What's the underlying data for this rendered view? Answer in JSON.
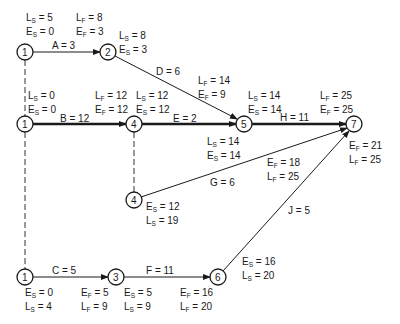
{
  "diagram": {
    "type": "PERT / CPM activity network",
    "nodes": [
      {
        "id": "n1a",
        "label": "1",
        "x": 25,
        "y": 52
      },
      {
        "id": "n2",
        "label": "2",
        "x": 108,
        "y": 52
      },
      {
        "id": "n1b",
        "label": "1",
        "x": 25,
        "y": 124
      },
      {
        "id": "n4a",
        "label": "4",
        "x": 134,
        "y": 124
      },
      {
        "id": "n5",
        "label": "5",
        "x": 244,
        "y": 124
      },
      {
        "id": "n7",
        "label": "7",
        "x": 354,
        "y": 124
      },
      {
        "id": "n4b",
        "label": "4",
        "x": 134,
        "y": 200
      },
      {
        "id": "n1c",
        "label": "1",
        "x": 25,
        "y": 277
      },
      {
        "id": "n3",
        "label": "3",
        "x": 116,
        "y": 277
      },
      {
        "id": "n6",
        "label": "6",
        "x": 218,
        "y": 277
      }
    ],
    "activities": [
      {
        "label": "A = 3",
        "from": "1",
        "to": "2",
        "critical": false
      },
      {
        "label": "B = 12",
        "from": "1",
        "to": "4",
        "critical": true
      },
      {
        "label": "C = 5",
        "from": "1",
        "to": "3",
        "critical": false
      },
      {
        "label": "D = 6",
        "from": "2",
        "to": "5",
        "critical": false
      },
      {
        "label": "E = 2",
        "from": "4",
        "to": "5",
        "critical": true
      },
      {
        "label": "F = 11",
        "from": "3",
        "to": "6",
        "critical": false
      },
      {
        "label": "G = 6",
        "from": "4",
        "to": "7",
        "critical": false
      },
      {
        "label": "H = 11",
        "from": "5",
        "to": "7",
        "critical": true
      },
      {
        "label": "J = 5",
        "from": "6",
        "to": "7",
        "critical": false
      }
    ],
    "annotations": {
      "A_start": {
        "l1": "L",
        "l1s": "S",
        "l1v": " = 5",
        "l2": "E",
        "l2s": "S",
        "l2v": " = 0"
      },
      "A_finish": {
        "l1": "L",
        "l1s": "F",
        "l1v": " = 8",
        "l2": "E",
        "l2s": "F",
        "l2v": " = 3"
      },
      "D_start": {
        "l1": "L",
        "l1s": "S",
        "l1v": " = 8",
        "l2": "E",
        "l2s": "S",
        "l2v": " = 3"
      },
      "D_finish": {
        "l1": "L",
        "l1s": "F",
        "l1v": " = 14",
        "l2": "E",
        "l2s": "F",
        "l2v": " = 9"
      },
      "B_start": {
        "l1": "L",
        "l1s": "S",
        "l1v": " = 0",
        "l2": "E",
        "l2s": "S",
        "l2v": " = 0"
      },
      "B_finish": {
        "l1": "L",
        "l1s": "F",
        "l1v": " = 12",
        "l2": "E",
        "l2s": "F",
        "l2v": " = 12"
      },
      "E_start": {
        "l1": "L",
        "l1s": "S",
        "l1v": " = 12",
        "l2": "E",
        "l2s": "S",
        "l2v": " = 12"
      },
      "E_finish": {
        "l1": "L",
        "l1s": "S",
        "l1v": " = 14",
        "l2": "E",
        "l2s": "S",
        "l2v": " = 14"
      },
      "H_start": {
        "l1": "L",
        "l1s": "S",
        "l1v": " = 14",
        "l2": "E",
        "l2s": "S",
        "l2v": " = 14"
      },
      "H_finish": {
        "l1": "L",
        "l1s": "F",
        "l1v": " = 25",
        "l2": "E",
        "l2s": "F",
        "l2v": " = 25"
      },
      "G_start": {
        "l1": "E",
        "l1s": "S",
        "l1v": " = 12",
        "l2": "L",
        "l2s": "S",
        "l2v": " = 19"
      },
      "G_finish": {
        "l1": "E",
        "l1s": "F",
        "l1v": " = 18",
        "l2": "L",
        "l2s": "F",
        "l2v": " = 25"
      },
      "J_finish": {
        "l1": "E",
        "l1s": "F",
        "l1v": " = 21",
        "l2": "L",
        "l2s": "F",
        "l2v": " = 25"
      },
      "J_start": {
        "l1": "E",
        "l1s": "S",
        "l1v": " = 16",
        "l2": "L",
        "l2s": "S",
        "l2v": " = 20"
      },
      "C_start": {
        "l1": "E",
        "l1s": "S",
        "l1v": " = 0",
        "l2": "L",
        "l2s": "S",
        "l2v": " = 4"
      },
      "C_finish": {
        "l1": "E",
        "l1s": "F",
        "l1v": " = 5",
        "l2": "L",
        "l2s": "F",
        "l2v": " = 9"
      },
      "F_start": {
        "l1": "E",
        "l1s": "S",
        "l1v": " = 5",
        "l2": "L",
        "l2s": "S",
        "l2v": " = 9"
      },
      "F_finish": {
        "l1": "E",
        "l1s": "F",
        "l1v": " = 16",
        "l2": "L",
        "l2s": "F",
        "l2v": " = 20"
      }
    }
  }
}
